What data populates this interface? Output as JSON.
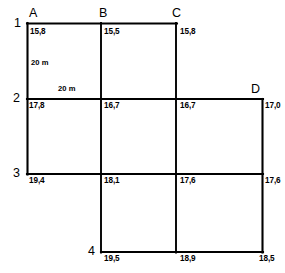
{
  "diagram": {
    "type": "survey-elevation-grid",
    "decimal_separator": ",",
    "unit_label": "m",
    "columns": [
      {
        "id": "A",
        "label": "A"
      },
      {
        "id": "B",
        "label": "B"
      },
      {
        "id": "C",
        "label": "C"
      },
      {
        "id": "D",
        "label": "D"
      }
    ],
    "rows": [
      {
        "id": "1",
        "label": "1"
      },
      {
        "id": "2",
        "label": "2"
      },
      {
        "id": "3",
        "label": "3"
      },
      {
        "id": "4",
        "label": "4"
      }
    ],
    "dimensions": [
      {
        "id": "vertical-spacing",
        "label": "20 m",
        "orientation": "vertical"
      },
      {
        "id": "horizontal-spacing",
        "label": "20 m",
        "orientation": "horizontal"
      }
    ],
    "elevations": [
      {
        "id": "A1",
        "column": "A",
        "row": "1",
        "value": "15,8"
      },
      {
        "id": "B1",
        "column": "B",
        "row": "1",
        "value": "15,5"
      },
      {
        "id": "C1",
        "column": "C",
        "row": "1",
        "value": "15,8"
      },
      {
        "id": "A2",
        "column": "A",
        "row": "2",
        "value": "17,8"
      },
      {
        "id": "B2",
        "column": "B",
        "row": "2",
        "value": "16,7"
      },
      {
        "id": "C2",
        "column": "C",
        "row": "2",
        "value": "16,7"
      },
      {
        "id": "D2",
        "column": "D",
        "row": "2",
        "value": "17,0"
      },
      {
        "id": "A3",
        "column": "A",
        "row": "3",
        "value": "19,4"
      },
      {
        "id": "B3",
        "column": "B",
        "row": "3",
        "value": "18,1"
      },
      {
        "id": "C3",
        "column": "C",
        "row": "3",
        "value": "17,6"
      },
      {
        "id": "D3",
        "column": "D",
        "row": "3",
        "value": "17,6"
      },
      {
        "id": "B4",
        "column": "B",
        "row": "4",
        "value": "19,5"
      },
      {
        "id": "C4",
        "column": "C",
        "row": "4",
        "value": "18,9"
      },
      {
        "id": "D4",
        "column": "D",
        "row": "4",
        "value": "18,5"
      }
    ]
  }
}
